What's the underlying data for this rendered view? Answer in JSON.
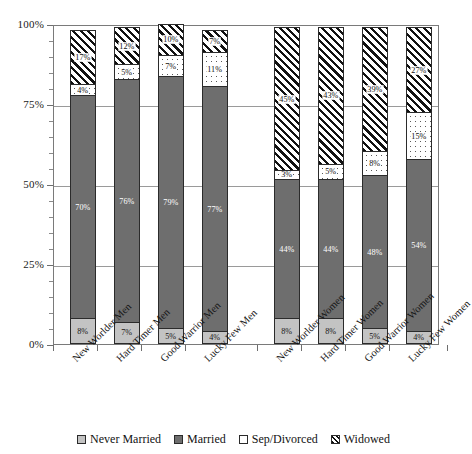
{
  "chart_data": {
    "type": "bar",
    "subtype": "stacked-bar-100-percent",
    "title": "",
    "xlabel": "",
    "ylabel": "",
    "ylim": [
      0,
      100
    ],
    "ytick_labels": [
      "0%",
      "25%",
      "50%",
      "75%",
      "100%"
    ],
    "ytick_values": [
      0,
      25,
      50,
      75,
      100
    ],
    "grid": true,
    "legend_position": "bottom",
    "categories": [
      "New Worlder Men",
      "Hard Timer Men",
      "Good Warrior Men",
      "Lucky Few Men",
      "New Worlder Women",
      "Hard Timer Women",
      "Good Warrior Women",
      "Lucky Few Women"
    ],
    "group_gap_after_index": 3,
    "series": [
      {
        "name": "Never Married",
        "values": [
          8,
          7,
          5,
          4,
          8,
          8,
          5,
          4
        ],
        "labels": [
          "8%",
          "7%",
          "5%",
          "4%",
          "8%",
          "8%",
          "5%",
          "4%"
        ],
        "fill": "light-grey-solid",
        "color": "#c3c3c3"
      },
      {
        "name": "Married",
        "values": [
          70,
          76,
          79,
          77,
          44,
          44,
          48,
          54
        ],
        "labels": [
          "70%",
          "76%",
          "79%",
          "77%",
          "44%",
          "44%",
          "48%",
          "54%"
        ],
        "fill": "dark-grey-solid",
        "color": "#6e6e6e"
      },
      {
        "name": "Sep/Divorced",
        "values": [
          4,
          5,
          7,
          11,
          3,
          5,
          8,
          15
        ],
        "labels": [
          "4%",
          "5%",
          "7%",
          "11%",
          "3%",
          "5%",
          "8%",
          "15%"
        ],
        "fill": "white-dotted",
        "color": "#ffffff"
      },
      {
        "name": "Widowed",
        "values": [
          17,
          12,
          10,
          7,
          45,
          43,
          39,
          27
        ],
        "labels": [
          "17%",
          "12%",
          "10%",
          "7%",
          "45%",
          "43%",
          "39%",
          "27%"
        ],
        "fill": "diagonal-hatch",
        "color": "#111111"
      }
    ]
  },
  "legend": {
    "items": [
      {
        "label": "Never Married",
        "swatch": "never"
      },
      {
        "label": "Married",
        "swatch": "married"
      },
      {
        "label": "Sep/Divorced",
        "swatch": "sep"
      },
      {
        "label": "Widowed",
        "swatch": "widowed"
      }
    ]
  }
}
